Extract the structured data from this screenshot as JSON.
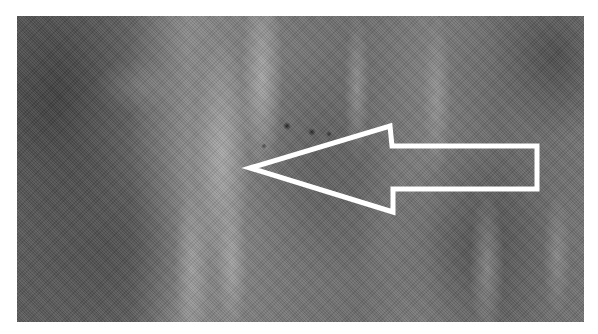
{
  "image": {
    "description": "Grayscale textured tissue-like image with a white outlined arrow annotation pointing left",
    "colors": {
      "background": "#ffffff",
      "tissue_mid": "#6e6e6e",
      "arrow_stroke": "#ffffff"
    },
    "arrow": {
      "direction": "left",
      "icon": "arrow-left-outline-icon",
      "points": "250,168 390,126 392,146 537,146 537,189 393,189 393,212"
    }
  }
}
